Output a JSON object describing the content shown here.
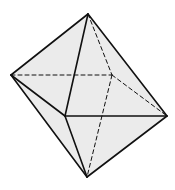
{
  "diagram": {
    "type": "octahedron",
    "fill_color": "#ebebeb",
    "stroke_color": "#111111",
    "background": "#ffffff",
    "vertices": {
      "top": [
        88,
        14
      ],
      "left": [
        11,
        75
      ],
      "right": [
        167,
        116
      ],
      "bottom": [
        87,
        177
      ],
      "front": [
        65,
        116
      ],
      "back": [
        112,
        75
      ]
    },
    "visible_edges": [
      [
        "top",
        "left"
      ],
      [
        "top",
        "front"
      ],
      [
        "top",
        "right"
      ],
      [
        "left",
        "front"
      ],
      [
        "front",
        "right"
      ],
      [
        "left",
        "bottom"
      ],
      [
        "front",
        "bottom"
      ],
      [
        "bottom",
        "right"
      ]
    ],
    "hidden_edges": [
      [
        "left",
        "back"
      ],
      [
        "back",
        "right"
      ],
      [
        "top",
        "back"
      ],
      [
        "back",
        "bottom"
      ]
    ],
    "outline": [
      "top",
      "right",
      "bottom",
      "left"
    ]
  }
}
